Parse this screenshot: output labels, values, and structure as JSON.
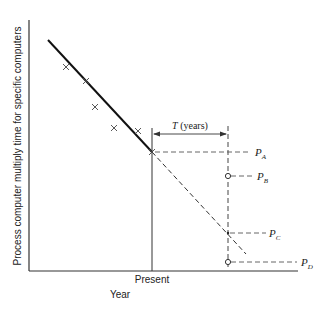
{
  "figure": {
    "y_axis_label": "Process computer multiply time for specific computers",
    "x_axis_label": "Year",
    "present_label": "Present",
    "interval_label_var": "T",
    "interval_label_unit": " (years)",
    "points": [
      {
        "letter": "P",
        "sub": "A"
      },
      {
        "letter": "P",
        "sub": "B"
      },
      {
        "letter": "P",
        "sub": "C"
      },
      {
        "letter": "P",
        "sub": "D"
      }
    ],
    "historical_marker": "×"
  }
}
